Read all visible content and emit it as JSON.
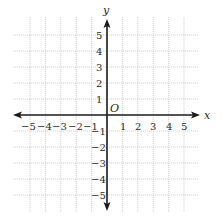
{
  "diagram": {
    "type": "coordinate-plane",
    "x_axis_label": "x",
    "y_axis_label": "y",
    "origin_label": "O",
    "x_range": [
      -5,
      5
    ],
    "y_range": [
      -5,
      5
    ],
    "x_ticks": [
      "−5",
      "−4",
      "−3",
      "−2",
      "−1",
      "1",
      "2",
      "3",
      "4",
      "5"
    ],
    "y_ticks_positive": [
      "5",
      "4",
      "3",
      "2",
      "1"
    ],
    "y_ticks_negative": [
      "−1",
      "−2",
      "−3",
      "−4",
      "−5"
    ],
    "grid": true,
    "colors": {
      "axis": "#1a1a1a",
      "grid": "#c8c8c8",
      "text": "#2a2a2a"
    }
  }
}
